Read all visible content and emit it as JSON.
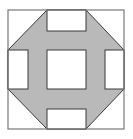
{
  "diagram": {
    "type": "quilt-block",
    "pattern": "churn-dash",
    "colors": {
      "background": "#ffffff",
      "fill": "#b9b9b9",
      "stroke": "#3a3a3a",
      "outer_stroke": "#7a7a7a"
    },
    "outer": {
      "x": 8,
      "y": 10,
      "w": 116,
      "h": 119
    },
    "grid": {
      "x": [
        8,
        47,
        86,
        124
      ],
      "y": [
        10,
        50,
        89,
        129
      ]
    },
    "side_split": {
      "top_y": 31,
      "bottom_y": 109,
      "left_x": 28,
      "right_x": 105
    }
  }
}
